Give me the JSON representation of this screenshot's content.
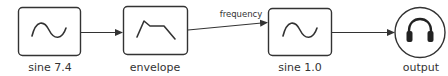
{
  "diagram": {
    "nodes": [
      {
        "id": "sine1",
        "label": "sine 7.4",
        "shape": "box",
        "icon": "sine-wave-icon"
      },
      {
        "id": "envelope",
        "label": "envelope",
        "shape": "box",
        "icon": "envelope-shape-icon"
      },
      {
        "id": "sine2",
        "label": "sine 1.0",
        "shape": "box",
        "icon": "sine-wave-icon"
      },
      {
        "id": "output",
        "label": "output",
        "shape": "circle",
        "icon": "headphones-icon"
      }
    ],
    "edges": [
      {
        "from": "sine1",
        "to": "envelope",
        "label": ""
      },
      {
        "from": "envelope",
        "to": "sine2",
        "label": "frequency"
      },
      {
        "from": "sine2",
        "to": "output",
        "label": ""
      }
    ],
    "colors": {
      "stroke": "#333333",
      "background": "#ffffff"
    }
  }
}
